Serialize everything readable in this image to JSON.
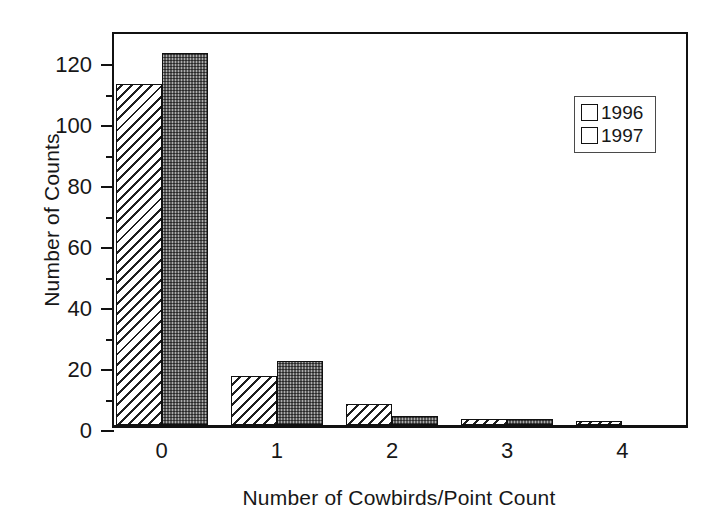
{
  "chart_data": {
    "type": "bar",
    "title": "",
    "xlabel": "Number of Cowbirds/Point Count",
    "ylabel": "Number of Counts",
    "categories": [
      "0",
      "1",
      "2",
      "3",
      "4"
    ],
    "series": [
      {
        "name": "1996",
        "values": [
          112,
          16,
          7,
          2,
          1
        ],
        "pattern": "diagonal-hatch",
        "color": "#f2f2f2"
      },
      {
        "name": "1997",
        "values": [
          122,
          21,
          3,
          2,
          0
        ],
        "pattern": "dark-stipple",
        "color": "#5b5b5b"
      }
    ],
    "ylim": [
      0,
      130
    ],
    "ytick_values": [
      0,
      20,
      40,
      60,
      80,
      100,
      120
    ],
    "ytick_labels": [
      "0",
      "20",
      "40",
      "60",
      "80",
      "100",
      "120"
    ],
    "yminor_values": [
      10,
      30,
      50,
      70,
      90,
      110
    ],
    "xtick_labels": [
      "0",
      "1",
      "2",
      "3",
      "4"
    ],
    "grid": false,
    "legend_position": "upper right",
    "legend_entries": [
      "1996",
      "1997"
    ]
  },
  "legend": {
    "items": [
      {
        "label": "1996"
      },
      {
        "label": "1997"
      }
    ]
  }
}
